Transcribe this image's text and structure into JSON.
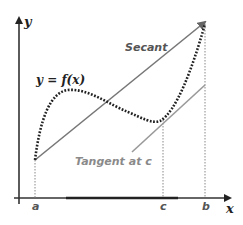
{
  "diagram": {
    "axes": {
      "x_label": "x",
      "y_label": "y"
    },
    "function_label": "y = f(x)",
    "secant_label": "Secant",
    "tangent_label": "Tangent at c",
    "points": {
      "a": "a",
      "b": "b",
      "c": "c"
    },
    "colors": {
      "axis": "#222222",
      "curve": "#222222",
      "secant": "#777777",
      "tangent": "#999999",
      "guides": "#999999",
      "tangent_label": "#8a8a8a",
      "secant_label": "#555555"
    }
  }
}
